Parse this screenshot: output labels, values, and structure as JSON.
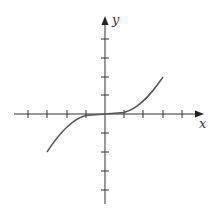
{
  "figure": {
    "type": "function-graph",
    "x_label": "x",
    "y_label": "y",
    "x_ticks": [
      -5,
      -4,
      -3,
      -2,
      -1,
      1,
      2,
      3,
      4,
      5
    ],
    "y_ticks": [
      -5,
      -4,
      -3,
      -2,
      -1,
      1,
      2,
      3,
      4
    ],
    "curve": "cubic, flat near origin",
    "curve_domain": [
      -3,
      3
    ],
    "curve_range": [
      -2,
      2
    ],
    "colors": {
      "axis": "#333333",
      "curve": "#555555",
      "background": "#ffffff"
    }
  }
}
